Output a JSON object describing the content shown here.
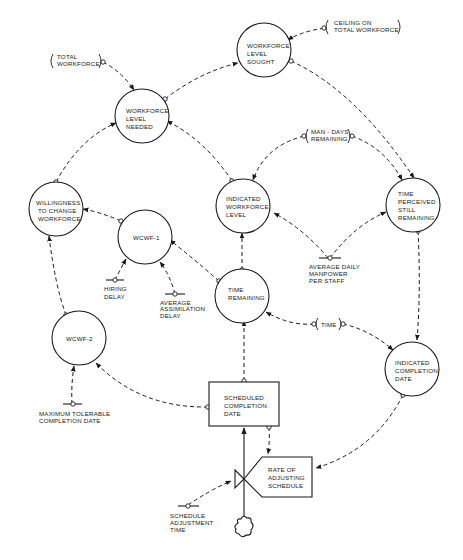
{
  "diagram": {
    "type": "system-dynamics-flow-diagram",
    "colors": {
      "ink": "#1a1a1a",
      "background": "#ffffff"
    },
    "auxiliaries": [
      {
        "id": "workforce_level_sought",
        "lines": [
          "WORKFORCE",
          "LEVEL",
          "SOUGHT"
        ]
      },
      {
        "id": "workforce_level_needed",
        "lines": [
          "WORKFORCE",
          "LEVEL",
          "NEEDED"
        ]
      },
      {
        "id": "willingness",
        "lines": [
          "WILLINGNESS",
          "TO CHANGE",
          "WORKFORCE"
        ]
      },
      {
        "id": "wcwf1",
        "lines": [
          "WCWF-1"
        ]
      },
      {
        "id": "indicated_workforce_level",
        "lines": [
          "INDICATED",
          "WORKFORCE",
          "LEVEL"
        ]
      },
      {
        "id": "time_perceived",
        "lines": [
          "TIME",
          "PERCEIVED",
          "STILL",
          "REMAINING"
        ]
      },
      {
        "id": "time_remaining",
        "lines": [
          "TIME",
          "REMAINING"
        ]
      },
      {
        "id": "wcwf2",
        "lines": [
          "WCWF-2"
        ]
      },
      {
        "id": "indicated_completion_date",
        "lines": [
          "INDICATED",
          "COMPLETION",
          "DATE"
        ]
      }
    ],
    "level": {
      "id": "scheduled_completion_date",
      "lines": [
        "SCHEDULED",
        "COMPLETION",
        "DATE"
      ]
    },
    "rate": {
      "id": "rate_of_adjusting_schedule",
      "lines": [
        "RATE OF",
        "ADJUSTING",
        "SCHEDULE"
      ]
    },
    "constants": [
      {
        "id": "hiring_delay",
        "lines": [
          "HIRING",
          "DELAY"
        ]
      },
      {
        "id": "avg_assimilation_delay",
        "lines": [
          "AVERAGE",
          "ASSIMILATION",
          "DELAY"
        ]
      },
      {
        "id": "avg_daily_manpower",
        "lines": [
          "AVERAGE DAILY",
          "MANPOWER",
          "PER STAFF"
        ]
      },
      {
        "id": "max_tolerable",
        "lines": [
          "MAXIMUM TOLERABLE",
          "COMPLETION DATE"
        ]
      },
      {
        "id": "schedule_adjustment_time",
        "lines": [
          "SCHEDULE",
          "ADJUSTMENT",
          "TIME"
        ]
      }
    ],
    "external_inputs": [
      {
        "id": "total_workforce",
        "lines": [
          "TOTAL",
          "WORKFORCE"
        ]
      },
      {
        "id": "ceiling",
        "lines": [
          "CEILING ON",
          "TOTAL WORKFORCE"
        ]
      },
      {
        "id": "man_days_remaining",
        "lines": [
          "MAN - DAYS",
          "REMAINING"
        ]
      },
      {
        "id": "time",
        "lines": [
          "TIME"
        ]
      }
    ]
  }
}
